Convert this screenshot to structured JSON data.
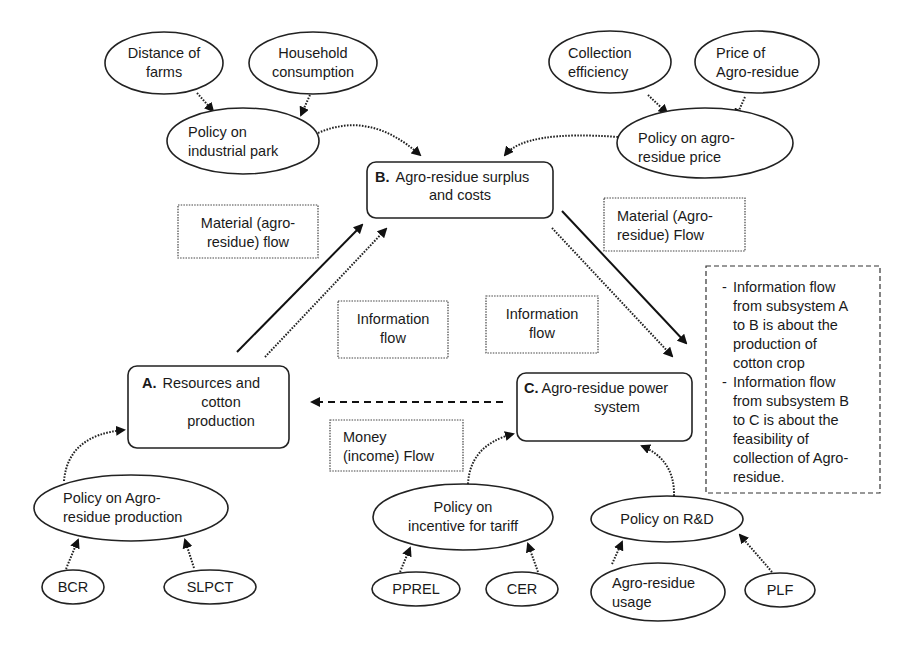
{
  "diagram": {
    "subsystems": {
      "A": {
        "letter": "A.",
        "lines": [
          "Resources and",
          "cotton",
          "production"
        ]
      },
      "B": {
        "letter": "B.",
        "lines": [
          "Agro-residue surplus",
          "and costs"
        ]
      },
      "C": {
        "letter": "C.",
        "lines": [
          "Agro-residue power",
          "system"
        ]
      }
    },
    "policies": {
      "industrial_park": {
        "lines": [
          "Policy on",
          "industrial park"
        ]
      },
      "agro_residue_price": {
        "lines": [
          "Policy on agro-",
          "residue price"
        ]
      },
      "agro_residue_production": {
        "lines": [
          "Policy on Agro-",
          "residue production"
        ]
      },
      "incentive_tariff": {
        "lines": [
          "Policy on",
          "incentive for tariff"
        ]
      },
      "rnd": {
        "lines": [
          "Policy on R&D"
        ]
      }
    },
    "factors": {
      "distance_of_farms": {
        "lines": [
          "Distance of",
          "farms"
        ]
      },
      "household_consumption": {
        "lines": [
          "Household",
          "consumption"
        ]
      },
      "collection_efficiency": {
        "lines": [
          "Collection",
          "efficiency"
        ]
      },
      "price_of_agro_residue": {
        "lines": [
          "Price of",
          "Agro-residue"
        ]
      },
      "bcr": {
        "lines": [
          "BCR"
        ]
      },
      "slpct": {
        "lines": [
          "SLPCT"
        ]
      },
      "pprel": {
        "lines": [
          "PPREL"
        ]
      },
      "cer": {
        "lines": [
          "CER"
        ]
      },
      "agro_residue_usage": {
        "lines": [
          "Agro-residue",
          "usage"
        ]
      },
      "plf": {
        "lines": [
          "PLF"
        ]
      }
    },
    "flow_labels": {
      "material_ab": {
        "lines": [
          "Material (agro-",
          "residue) flow"
        ]
      },
      "material_bc": {
        "lines": [
          "Material (Agro-",
          "residue) Flow"
        ]
      },
      "information_ab": {
        "lines": [
          "Information",
          "flow"
        ]
      },
      "information_bc": {
        "lines": [
          "Information",
          "flow"
        ]
      },
      "money": {
        "lines": [
          "Money",
          "(income) Flow"
        ]
      }
    },
    "note": {
      "bullets": [
        {
          "dash": "-",
          "lines": [
            "Information flow",
            "from subsystem A",
            "to B is about the",
            "production of",
            "cotton crop"
          ]
        },
        {
          "dash": "-",
          "lines": [
            "Information flow",
            "from subsystem B",
            "to C is about the",
            "feasibility of",
            "collection of Agro-",
            "residue."
          ]
        }
      ]
    }
  }
}
